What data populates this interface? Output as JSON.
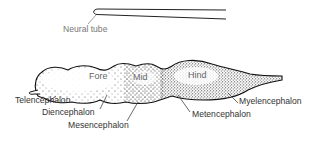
{
  "diagram": {
    "neural_tube_label": "Neural tube",
    "regions": {
      "fore": "Fore",
      "mid": "Mid",
      "hind": "Hind"
    },
    "labels": {
      "telencephalon": "Telencephalon",
      "diencephalon": "Diencephalon",
      "mesencephalon": "Mesencephalon",
      "metencephalon": "Metencephalon",
      "myelencephalon": "Myelencephalon"
    }
  }
}
